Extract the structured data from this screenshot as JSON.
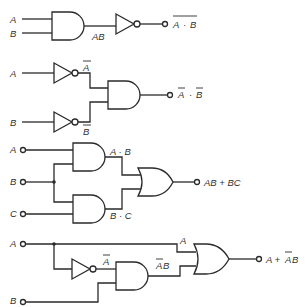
{
  "diagram": {
    "type": "logic-gate-circuits",
    "circuits": [
      {
        "name": "nand",
        "inputs": [
          "A",
          "B"
        ],
        "intermediate": "AB",
        "output": "A · B",
        "output_overline": true,
        "gates": [
          "AND",
          "NOT"
        ]
      },
      {
        "name": "and-of-inverted",
        "inputs": [
          "A",
          "B"
        ],
        "intermediate": [
          "A",
          "B"
        ],
        "intermediate_overline": [
          true,
          true
        ],
        "output": "A · B",
        "output_note": "each term overlined",
        "gates": [
          "NOT",
          "NOT",
          "AND"
        ]
      },
      {
        "name": "and-or",
        "inputs": [
          "A",
          "B",
          "C"
        ],
        "intermediate": [
          "A · B",
          "B · C"
        ],
        "output": "AB + BC",
        "gates": [
          "AND",
          "AND",
          "OR"
        ]
      },
      {
        "name": "absorption",
        "inputs": [
          "A",
          "B"
        ],
        "intermediate": [
          "A",
          "A",
          "AB"
        ],
        "intermediate_overline": [
          false,
          true,
          "A only"
        ],
        "output": "A + AB",
        "output_note": "A overlined in second term",
        "gates": [
          "NOT",
          "AND",
          "OR"
        ]
      }
    ]
  },
  "labels": {
    "c1_a": "A",
    "c1_b": "B",
    "c1_mid": "AB",
    "c1_out_a": "A",
    "c1_out_dot": "·",
    "c1_out_b": "B",
    "c2_a": "A",
    "c2_b": "B",
    "c2_abar": "A",
    "c2_bbar": "B",
    "c2_out_a": "A",
    "c2_out_dot": "·",
    "c2_out_b": "B",
    "c3_a": "A",
    "c3_b": "B",
    "c3_c": "C",
    "c3_ab": "A · B",
    "c3_bc": "B · C",
    "c3_out": "AB + BC",
    "c4_a": "A",
    "c4_b": "B",
    "c4_abar": "A",
    "c4_a_top": "A",
    "c4_abar_b_a": "A",
    "c4_abar_b_b": "B",
    "c4_out_pre": "A + ",
    "c4_out_a": "A",
    "c4_out_b": "B"
  }
}
